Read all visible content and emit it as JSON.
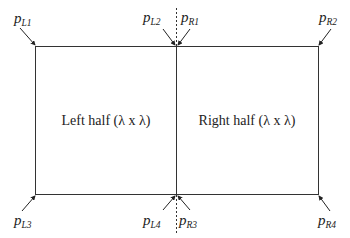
{
  "diagram": {
    "type": "split-square",
    "regions": [
      {
        "id": "left",
        "label": "Left half (λ x λ)"
      },
      {
        "id": "right",
        "label": "Right half (λ x λ)"
      }
    ],
    "points": {
      "pL1": {
        "base": "p",
        "sub": "L1"
      },
      "pL2": {
        "base": "p",
        "sub": "L2"
      },
      "pR1": {
        "base": "p",
        "sub": "R1"
      },
      "pR2": {
        "base": "p",
        "sub": "R2"
      },
      "pL3": {
        "base": "p",
        "sub": "L3"
      },
      "pL4": {
        "base": "p",
        "sub": "L4"
      },
      "pR3": {
        "base": "p",
        "sub": "R3"
      },
      "pR4": {
        "base": "p",
        "sub": "R4"
      }
    },
    "colors": {
      "line": "#333333",
      "text": "#222222",
      "background": "#ffffff"
    }
  }
}
